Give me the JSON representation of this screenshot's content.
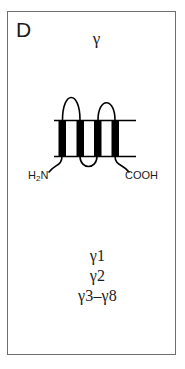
{
  "panel": {
    "letter": "D",
    "title": "γ",
    "border_color": "#6e6e6e",
    "background_color": "#ffffff"
  },
  "diagram": {
    "name": "gamma-subunit-membrane-topology",
    "stroke_color": "#000000",
    "helix_fill_color": "#000000",
    "transmembrane_helix_count": 4,
    "extracellular_loop_count": 2,
    "intracellular_loop_count": 1,
    "membrane_line_top_y": 120,
    "membrane_line_bottom_y": 156,
    "n_terminus_label": "H",
    "n_terminus_sub": "2",
    "n_terminus_label_tail": "N",
    "c_terminus_label": "COOH"
  },
  "legend": {
    "items": [
      {
        "label": "γ1"
      },
      {
        "label": "γ2"
      },
      {
        "label": "γ3–γ8"
      }
    ]
  }
}
